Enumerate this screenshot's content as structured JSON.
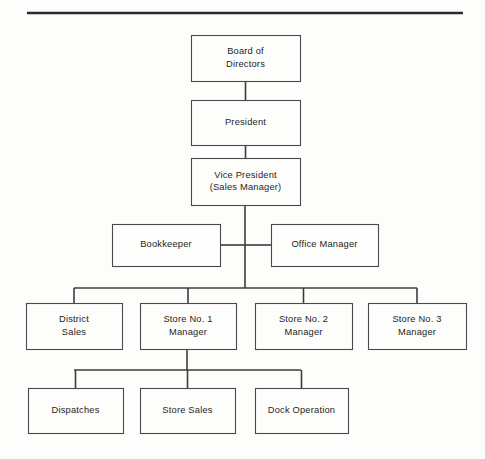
{
  "page": {
    "background_color": "#fdfdfb",
    "line_color": "#3c3c3c",
    "box_border_color": "#4a4a4a",
    "text_color": "#1d1d1d",
    "width": 485,
    "height": 459
  },
  "top_rule": {
    "name": "top-horizontal-rule",
    "x1": 27,
    "x2": 463,
    "y": 13,
    "color": "#2a2a2a"
  },
  "chart_data": {
    "type": "diagram",
    "nodes": [
      {
        "id": "board-of-directors",
        "lines": [
          "Board of",
          "Directors"
        ],
        "text": "Board of Directors",
        "level": 0,
        "x": 191,
        "y": 35,
        "w": 109,
        "h": 46
      },
      {
        "id": "president",
        "lines": [
          "President"
        ],
        "text": "President",
        "level": 1,
        "x": 191,
        "y": 100,
        "w": 109,
        "h": 45
      },
      {
        "id": "vice-president",
        "lines": [
          "Vice President",
          "(Sales Manager)"
        ],
        "text": "Vice President (Sales Manager)",
        "level": 2,
        "x": 191,
        "y": 158,
        "w": 109,
        "h": 47
      },
      {
        "id": "bookkeeper",
        "lines": [
          "Bookkeeper"
        ],
        "text": "Bookkeeper",
        "level": 3,
        "x": 112,
        "y": 224,
        "w": 108,
        "h": 42
      },
      {
        "id": "office-manager",
        "lines": [
          "Office Manager"
        ],
        "text": "Office Manager",
        "level": 3,
        "x": 271,
        "y": 224,
        "w": 107,
        "h": 42
      },
      {
        "id": "district-sales",
        "lines": [
          "District",
          "Sales"
        ],
        "text": "District Sales",
        "level": 4,
        "x": 26,
        "y": 303,
        "w": 96,
        "h": 46
      },
      {
        "id": "store-no-1-manager",
        "lines": [
          "Store No. 1",
          "Manager"
        ],
        "text": "Store No. 1 Manager",
        "level": 4,
        "x": 140,
        "y": 303,
        "w": 96,
        "h": 46
      },
      {
        "id": "store-no-2-manager",
        "lines": [
          "Store No. 2",
          "Manager"
        ],
        "text": "Store No. 2 Manager",
        "level": 4,
        "x": 255,
        "y": 303,
        "w": 97,
        "h": 46
      },
      {
        "id": "store-no-3-manager",
        "lines": [
          "Store No. 3",
          "Manager"
        ],
        "text": "Store No. 3 Manager",
        "level": 4,
        "x": 368,
        "y": 303,
        "w": 98,
        "h": 46
      },
      {
        "id": "dispatches",
        "lines": [
          "Dispatches"
        ],
        "text": "Dispatches",
        "level": 5,
        "x": 28,
        "y": 388,
        "w": 95,
        "h": 45
      },
      {
        "id": "store-sales",
        "lines": [
          "Store Sales"
        ],
        "text": "Store Sales",
        "level": 5,
        "x": 140,
        "y": 388,
        "w": 95,
        "h": 45
      },
      {
        "id": "dock-operation",
        "lines": [
          "Dock Operation"
        ],
        "text": "Dock Operation",
        "level": 5,
        "x": 255,
        "y": 388,
        "w": 93,
        "h": 45
      }
    ],
    "edges": [
      {
        "id": "edge-board-president",
        "from": "board-of-directors",
        "to": "president",
        "type": "vertical"
      },
      {
        "id": "edge-president-vp",
        "from": "president",
        "to": "vice-president",
        "type": "vertical"
      },
      {
        "id": "edge-vp-bookkeeper",
        "from": "vice-president",
        "to": "bookkeeper",
        "type": "side"
      },
      {
        "id": "edge-vp-office-manager",
        "from": "vice-president",
        "to": "office-manager",
        "type": "side"
      },
      {
        "id": "edge-vp-district-sales",
        "from": "vice-president",
        "to": "district-sales",
        "type": "bus"
      },
      {
        "id": "edge-vp-store-1",
        "from": "vice-president",
        "to": "store-no-1-manager",
        "type": "bus"
      },
      {
        "id": "edge-vp-store-2",
        "from": "vice-president",
        "to": "store-no-2-manager",
        "type": "bus"
      },
      {
        "id": "edge-vp-store-3",
        "from": "vice-president",
        "to": "store-no-3-manager",
        "type": "bus"
      },
      {
        "id": "edge-store-1-dispatches",
        "from": "store-no-1-manager",
        "to": "dispatches",
        "type": "bus"
      },
      {
        "id": "edge-store-1-store-sales",
        "from": "store-no-1-manager",
        "to": "store-sales",
        "type": "bus"
      },
      {
        "id": "edge-store-1-dock-operation",
        "from": "store-no-1-manager",
        "to": "dock-operation",
        "type": "bus"
      }
    ],
    "connector_geometry": {
      "trunk_x": 245,
      "trunk_top": 205,
      "trunk_bottom": 288,
      "side_row_y": 245,
      "upper_bus_y": 288,
      "upper_bus_x1": 74,
      "upper_bus_x2": 417,
      "upper_bus_stems": [
        74,
        187,
        303,
        417
      ],
      "lower_bus_y": 370,
      "lower_bus_x1": 74,
      "lower_bus_x2": 301,
      "lower_bus_stems": [
        74,
        187,
        301
      ],
      "store1_stem_x": 187
    }
  }
}
